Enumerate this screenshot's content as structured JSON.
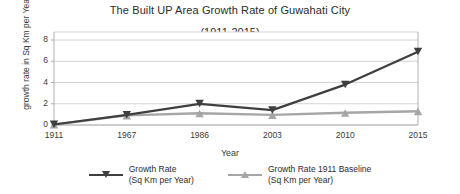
{
  "chart_data": {
    "type": "line",
    "title": "The Built UP Area Growth Rate of Guwahati City",
    "subtitle": "(1911-2015)",
    "xlabel": "Year",
    "ylabel": "growth rate in Sq Km per Year",
    "categories": [
      "1911",
      "1967",
      "1986",
      "2003",
      "2010",
      "2015"
    ],
    "ylim": [
      0,
      8
    ],
    "yticks": [
      "0",
      "2",
      "4",
      "6",
      "8"
    ],
    "ytick_values": [
      0,
      2,
      4,
      6,
      8
    ],
    "grid": true,
    "legend_position": "bottom",
    "series": [
      {
        "name": "Growth Rate",
        "unit": "(Sq Km per Year)",
        "color": "#3f3f3f",
        "marker": "triangle-down",
        "values": [
          0.05,
          0.95,
          2.0,
          1.4,
          3.8,
          6.9
        ]
      },
      {
        "name": "Growth Rate 1911 Baseline",
        "unit": "(Sq Km per Year)",
        "color": "#a6a6a6",
        "marker": "triangle-up",
        "values": [
          0.05,
          0.9,
          1.1,
          0.95,
          1.15,
          1.3
        ]
      }
    ]
  }
}
